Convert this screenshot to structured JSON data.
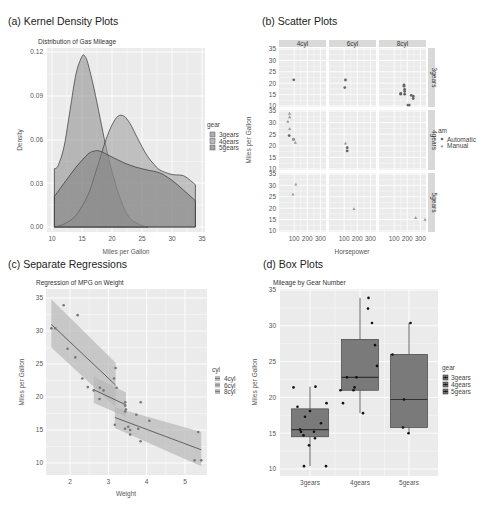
{
  "chart_data": [
    {
      "id": "a",
      "type": "area",
      "panel_title": "(a) Kernel Density Plots",
      "title": "Distribution of Gas Mileage",
      "xlabel": "Miles per Gallon",
      "ylabel": "Density",
      "xlim": [
        10,
        35
      ],
      "ylim": [
        0,
        0.12
      ],
      "xticks": [
        10,
        15,
        20,
        25,
        30,
        35
      ],
      "yticks": [
        "0.00",
        "0.03",
        "0.06",
        "0.09",
        "0.12"
      ],
      "legend": {
        "title": "gear",
        "entries": [
          "3gears",
          "4gears",
          "5gears"
        ]
      },
      "series": [
        {
          "name": "3gears",
          "x": [
            10.4,
            11,
            12,
            13,
            14,
            15,
            15.5,
            16,
            17,
            18,
            19,
            20,
            21,
            22,
            23,
            24,
            25,
            26
          ],
          "values": [
            0.04,
            0.042,
            0.055,
            0.08,
            0.105,
            0.117,
            0.117,
            0.112,
            0.095,
            0.075,
            0.055,
            0.038,
            0.024,
            0.013,
            0.006,
            0.003,
            0.001,
            0.0
          ]
        },
        {
          "name": "4gears",
          "x": [
            10.4,
            12,
            14,
            16,
            17,
            18,
            19,
            20,
            21,
            22,
            23,
            24,
            25,
            26,
            27,
            28,
            30,
            32,
            33.9
          ],
          "values": [
            0.0,
            0.002,
            0.008,
            0.022,
            0.034,
            0.047,
            0.06,
            0.07,
            0.076,
            0.076,
            0.071,
            0.063,
            0.055,
            0.048,
            0.043,
            0.039,
            0.036,
            0.035,
            0.029
          ]
        },
        {
          "name": "5gears",
          "x": [
            10.4,
            12,
            14,
            16,
            17,
            18,
            20,
            22,
            24,
            26,
            28,
            30,
            32,
            33.9
          ],
          "values": [
            0.021,
            0.03,
            0.041,
            0.05,
            0.052,
            0.052,
            0.048,
            0.044,
            0.041,
            0.039,
            0.037,
            0.032,
            0.025,
            0.018
          ]
        }
      ]
    },
    {
      "id": "b",
      "type": "scatter",
      "panel_title": "(b) Scatter Plots",
      "xlabel": "Horsepower",
      "ylabel": "Miles per Gallon",
      "facet_cols": [
        "4cyl",
        "6cyl",
        "8cyl"
      ],
      "facet_rows": [
        "3gears",
        "4gears",
        "5gears"
      ],
      "xticks": [
        100,
        200,
        300
      ],
      "yticks": [
        10,
        15,
        20,
        25,
        30,
        35
      ],
      "legend": {
        "title": "am",
        "entries": [
          "Automatic",
          "Manual"
        ]
      },
      "points": [
        {
          "col": 0,
          "row": 0,
          "hp": 97,
          "mpg": 21.5,
          "am": "Automatic"
        },
        {
          "col": 1,
          "row": 0,
          "hp": 110,
          "mpg": 21.4,
          "am": "Automatic"
        },
        {
          "col": 1,
          "row": 0,
          "hp": 105,
          "mpg": 18.1,
          "am": "Automatic"
        },
        {
          "col": 2,
          "row": 0,
          "hp": 175,
          "mpg": 18.7,
          "am": "Automatic"
        },
        {
          "col": 2,
          "row": 0,
          "hp": 245,
          "mpg": 14.3,
          "am": "Automatic"
        },
        {
          "col": 2,
          "row": 0,
          "hp": 180,
          "mpg": 16.4,
          "am": "Automatic"
        },
        {
          "col": 2,
          "row": 0,
          "hp": 180,
          "mpg": 17.3,
          "am": "Automatic"
        },
        {
          "col": 2,
          "row": 0,
          "hp": 180,
          "mpg": 15.2,
          "am": "Automatic"
        },
        {
          "col": 2,
          "row": 0,
          "hp": 205,
          "mpg": 10.4,
          "am": "Automatic"
        },
        {
          "col": 2,
          "row": 0,
          "hp": 215,
          "mpg": 10.4,
          "am": "Automatic"
        },
        {
          "col": 2,
          "row": 0,
          "hp": 230,
          "mpg": 14.7,
          "am": "Automatic"
        },
        {
          "col": 2,
          "row": 0,
          "hp": 150,
          "mpg": 15.5,
          "am": "Automatic"
        },
        {
          "col": 2,
          "row": 0,
          "hp": 150,
          "mpg": 15.2,
          "am": "Automatic"
        },
        {
          "col": 2,
          "row": 0,
          "hp": 245,
          "mpg": 13.3,
          "am": "Automatic"
        },
        {
          "col": 2,
          "row": 0,
          "hp": 175,
          "mpg": 19.2,
          "am": "Automatic"
        },
        {
          "col": 0,
          "row": 1,
          "hp": 62,
          "mpg": 24.4,
          "am": "Automatic"
        },
        {
          "col": 0,
          "row": 1,
          "hp": 95,
          "mpg": 22.8,
          "am": "Automatic"
        },
        {
          "col": 0,
          "row": 1,
          "hp": 93,
          "mpg": 22.8,
          "am": "Manual"
        },
        {
          "col": 0,
          "row": 1,
          "hp": 66,
          "mpg": 32.4,
          "am": "Manual"
        },
        {
          "col": 0,
          "row": 1,
          "hp": 52,
          "mpg": 30.4,
          "am": "Manual"
        },
        {
          "col": 0,
          "row": 1,
          "hp": 65,
          "mpg": 33.9,
          "am": "Manual"
        },
        {
          "col": 0,
          "row": 1,
          "hp": 66,
          "mpg": 27.3,
          "am": "Manual"
        },
        {
          "col": 0,
          "row": 1,
          "hp": 109,
          "mpg": 21.4,
          "am": "Manual"
        },
        {
          "col": 1,
          "row": 1,
          "hp": 110,
          "mpg": 21.0,
          "am": "Manual"
        },
        {
          "col": 1,
          "row": 1,
          "hp": 123,
          "mpg": 19.2,
          "am": "Automatic"
        },
        {
          "col": 1,
          "row": 1,
          "hp": 123,
          "mpg": 17.8,
          "am": "Automatic"
        },
        {
          "col": 0,
          "row": 2,
          "hp": 91,
          "mpg": 26.0,
          "am": "Manual"
        },
        {
          "col": 0,
          "row": 2,
          "hp": 113,
          "mpg": 30.4,
          "am": "Manual"
        },
        {
          "col": 1,
          "row": 2,
          "hp": 175,
          "mpg": 19.7,
          "am": "Manual"
        },
        {
          "col": 2,
          "row": 2,
          "hp": 264,
          "mpg": 15.8,
          "am": "Manual"
        },
        {
          "col": 2,
          "row": 2,
          "hp": 335,
          "mpg": 15.0,
          "am": "Manual"
        }
      ]
    },
    {
      "id": "c",
      "type": "scatter",
      "panel_title": "(c) Separate Regressions",
      "title": "Regression of MPG on Weight",
      "xlabel": "Weight",
      "ylabel": "Miles per Gallon",
      "xticks": [
        2,
        3,
        4,
        5
      ],
      "yticks": [
        10,
        15,
        20,
        25,
        30,
        35
      ],
      "legend": {
        "title": "cyl",
        "entries": [
          "4cyl",
          "6cyl",
          "8cyl"
        ]
      },
      "points": [
        [
          1.513,
          30.4
        ],
        [
          1.615,
          30.4
        ],
        [
          1.835,
          33.9
        ],
        [
          1.935,
          27.3
        ],
        [
          2.14,
          26.0
        ],
        [
          2.2,
          32.4
        ],
        [
          2.32,
          22.8
        ],
        [
          2.465,
          21.5
        ],
        [
          2.62,
          21.0
        ],
        [
          2.77,
          19.7
        ],
        [
          2.875,
          21.0
        ],
        [
          3.15,
          22.8
        ],
        [
          3.19,
          24.4
        ],
        [
          3.215,
          21.4
        ],
        [
          3.44,
          18.7
        ],
        [
          3.44,
          19.2
        ],
        [
          3.46,
          18.1
        ],
        [
          3.52,
          15.5
        ],
        [
          3.57,
          14.3
        ],
        [
          3.57,
          15.0
        ],
        [
          3.73,
          17.3
        ],
        [
          3.78,
          15.2
        ],
        [
          3.84,
          13.3
        ],
        [
          3.845,
          19.2
        ],
        [
          4.07,
          16.4
        ],
        [
          5.25,
          10.4
        ],
        [
          5.345,
          14.7
        ],
        [
          5.424,
          10.4
        ],
        [
          3.17,
          15.8
        ],
        [
          3.435,
          15.2
        ],
        [
          3.44,
          17.8
        ],
        [
          2.78,
          21.4
        ]
      ],
      "fits": [
        {
          "name": "4cyl",
          "x": [
            1.513,
            3.19
          ],
          "y": [
            31.0,
            21.8
          ],
          "band_lo": [
            27.5,
            18.5
          ],
          "band_hi": [
            34.8,
            25.2
          ]
        },
        {
          "name": "6cyl",
          "x": [
            2.62,
            3.46
          ],
          "y": [
            21.1,
            18.8
          ],
          "band_lo": [
            19.1,
            17.0
          ],
          "band_hi": [
            23.1,
            20.7
          ]
        },
        {
          "name": "8cyl",
          "x": [
            3.17,
            5.424
          ],
          "y": [
            16.9,
            12.0
          ],
          "band_lo": [
            15.3,
            9.5
          ],
          "band_hi": [
            18.4,
            14.7
          ]
        }
      ]
    },
    {
      "id": "d",
      "type": "box",
      "panel_title": "(d) Box Plots",
      "title": "Mileage by Gear Number",
      "xlabel": "",
      "ylabel": "Miles per Gallon",
      "categories": [
        "3gears",
        "4gears",
        "5gears"
      ],
      "yticks": [
        10,
        15,
        20,
        25,
        30,
        35
      ],
      "legend": {
        "title": "gear",
        "entries": [
          "3gears",
          "4gears",
          "5gears"
        ]
      },
      "boxes": [
        {
          "name": "3gears",
          "min": 10.4,
          "q1": 14.5,
          "median": 15.5,
          "q3": 18.4,
          "max": 21.5
        },
        {
          "name": "4gears",
          "min": 17.8,
          "q1": 21.0,
          "median": 22.8,
          "q3": 28.1,
          "max": 33.9
        },
        {
          "name": "5gears",
          "min": 15.0,
          "q1": 15.8,
          "median": 19.7,
          "q3": 26.0,
          "max": 30.4
        }
      ],
      "jitter_points": [
        {
          "cat": 0,
          "dx": -0.33,
          "mpg": 21.4
        },
        {
          "cat": 0,
          "dx": -0.25,
          "mpg": 18.7
        },
        {
          "cat": 0,
          "dx": 0.0,
          "mpg": 18.1
        },
        {
          "cat": 0,
          "dx": -0.1,
          "mpg": 17.3
        },
        {
          "cat": 0,
          "dx": 0.22,
          "mpg": 16.4
        },
        {
          "cat": 0,
          "dx": -0.18,
          "mpg": 15.2
        },
        {
          "cat": 0,
          "dx": -0.2,
          "mpg": 15.5
        },
        {
          "cat": 0,
          "dx": 0.08,
          "mpg": 15.2
        },
        {
          "cat": 0,
          "dx": -0.13,
          "mpg": 14.7
        },
        {
          "cat": 0,
          "dx": 0.1,
          "mpg": 14.3
        },
        {
          "cat": 0,
          "dx": -0.02,
          "mpg": 13.3
        },
        {
          "cat": 0,
          "dx": -0.12,
          "mpg": 10.4
        },
        {
          "cat": 0,
          "dx": 0.32,
          "mpg": 10.4
        },
        {
          "cat": 0,
          "dx": 0.11,
          "mpg": 21.5
        },
        {
          "cat": 0,
          "dx": 0.33,
          "mpg": 19.2
        },
        {
          "cat": 1,
          "dx": 0.17,
          "mpg": 33.9
        },
        {
          "cat": 1,
          "dx": 0.16,
          "mpg": 32.4
        },
        {
          "cat": 1,
          "dx": 0.24,
          "mpg": 30.4
        },
        {
          "cat": 1,
          "dx": 0.3,
          "mpg": 27.3
        },
        {
          "cat": 1,
          "dx": 0.34,
          "mpg": 24.4
        },
        {
          "cat": 1,
          "dx": -0.26,
          "mpg": 22.8
        },
        {
          "cat": 1,
          "dx": -0.07,
          "mpg": 22.8
        },
        {
          "cat": 1,
          "dx": -0.11,
          "mpg": 21.4
        },
        {
          "cat": 1,
          "dx": -0.13,
          "mpg": 21.0
        },
        {
          "cat": 1,
          "dx": -0.39,
          "mpg": 21.0
        },
        {
          "cat": 1,
          "dx": -0.34,
          "mpg": 19.2
        },
        {
          "cat": 1,
          "dx": 0.06,
          "mpg": 17.8
        },
        {
          "cat": 2,
          "dx": 0.03,
          "mpg": 30.4
        },
        {
          "cat": 2,
          "dx": -0.33,
          "mpg": 26.0
        },
        {
          "cat": 2,
          "dx": -0.1,
          "mpg": 19.7
        },
        {
          "cat": 2,
          "dx": -0.12,
          "mpg": 15.8
        },
        {
          "cat": 2,
          "dx": -0.01,
          "mpg": 15.0
        }
      ]
    }
  ],
  "colors": {
    "panel_bg": "#ebebeb",
    "grid": "#ffffff",
    "strip_bg": "#d9d9d9",
    "fill_3gears": "#8a8a8a",
    "fill_4gears": "#9a9a9a",
    "fill_5gears": "#7d7d7d",
    "box_fill": "#7a7a7a",
    "band": "#b8b8b8",
    "line": "#555555",
    "point": "#666666"
  }
}
